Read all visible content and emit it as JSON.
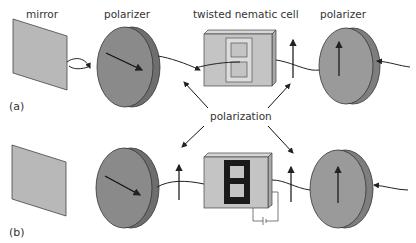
{
  "labels": {
    "mirror": "mirror",
    "polarizer_left": "polarizer",
    "cell": "twisted nematic cell",
    "polarizer_right": "polarizer",
    "polarization": "polarization",
    "panel_a": "(a)",
    "panel_b": "(b)"
  },
  "colors": {
    "mirror_fill": "#b8b8b8",
    "polarizer_left_fill": "#8a8a8a",
    "polarizer_right_fill": "#9a9a9a",
    "cell_fill": "#c4c4c4",
    "segment_dark": "#1a1a1a",
    "stroke": "#222222"
  },
  "panels": [
    {
      "id": "a",
      "state": "voltage off",
      "display_segments": "unlit (light passes, rotated 90°)"
    },
    {
      "id": "b",
      "state": "voltage on",
      "display_segments": "dark digit 8 (light blocked)"
    }
  ]
}
